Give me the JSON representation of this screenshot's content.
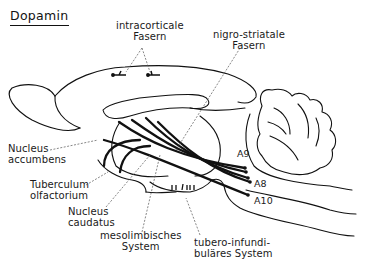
{
  "title": "Dopamin",
  "diagram": {
    "type": "anatomical-pathway-diagram",
    "labels": {
      "intracortical": [
        "intracorticale",
        "Fasern"
      ],
      "nigrostriatal": [
        "nigro-striatale",
        "Fasern"
      ],
      "accumbens": [
        "Nucleus",
        "accumbens"
      ],
      "tuberculum": [
        "Tuberculum",
        "olfactorium"
      ],
      "caudatus": [
        "Nucleus",
        "caudatus"
      ],
      "mesolimbic": [
        "mesolimbisches",
        "System"
      ],
      "tuberoinfundibular": [
        "tubero-infundi-",
        "buläres System"
      ]
    },
    "cell_groups": [
      "A9",
      "A8",
      "A10"
    ]
  },
  "colors": {
    "line": "#111111",
    "background": "#ffffff",
    "leader": "#444444"
  }
}
